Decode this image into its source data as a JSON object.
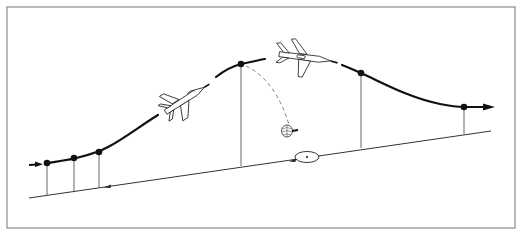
{
  "diagram": {
    "type": "flight-profile",
    "colors": {
      "frame": "#8a8a8a",
      "path": "#111111",
      "ground": "#333333",
      "drop_lines": "#555555",
      "ballistic": "#777777",
      "background": "#ffffff"
    },
    "waypoints": [
      {
        "id": "wp1",
        "x": 47,
        "y": 163
      },
      {
        "id": "wp2",
        "x": 74,
        "y": 158
      },
      {
        "id": "wp3",
        "x": 99,
        "y": 152
      },
      {
        "id": "wp4-release",
        "x": 241,
        "y": 64
      },
      {
        "id": "wp5",
        "x": 361,
        "y": 73
      },
      {
        "id": "wp6",
        "x": 464,
        "y": 107
      }
    ],
    "elements": {
      "aircraft_climbing": "aircraft-climb-icon",
      "aircraft_egress": "aircraft-egress-icon",
      "parachute": "parachute-icon",
      "target": "target-icon",
      "entry_arrow": "arrow-right-icon",
      "exit_arrow": "arrow-right-icon"
    }
  }
}
